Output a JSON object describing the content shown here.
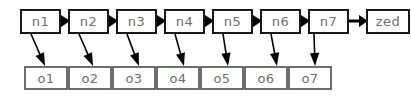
{
  "diagram": {
    "type": "linked-list-with-outputs",
    "background_color": "#fefefe",
    "node_stroke_color": "#1a1a1a",
    "output_stroke_color": "#4a4a4a",
    "label_color": "#6f6f6f",
    "arrow_color": "#000000",
    "chain": {
      "nodes": [
        {
          "id": "n1",
          "label": "n1",
          "x": 21,
          "y": 10,
          "w": 39,
          "h": 23
        },
        {
          "id": "n2",
          "label": "n2",
          "x": 69,
          "y": 10,
          "w": 39,
          "h": 23
        },
        {
          "id": "n3",
          "label": "n3",
          "x": 117,
          "y": 10,
          "w": 39,
          "h": 23
        },
        {
          "id": "n4",
          "label": "n4",
          "x": 165,
          "y": 10,
          "w": 39,
          "h": 23
        },
        {
          "id": "n5",
          "label": "n5",
          "x": 213,
          "y": 10,
          "w": 39,
          "h": 23
        },
        {
          "id": "n6",
          "label": "n6",
          "x": 261,
          "y": 10,
          "w": 39,
          "h": 23
        },
        {
          "id": "n7",
          "label": "n7",
          "x": 309,
          "y": 10,
          "w": 39,
          "h": 23
        },
        {
          "id": "zed",
          "label": "zed",
          "x": 367,
          "y": 10,
          "w": 42,
          "h": 23
        }
      ],
      "arrows": [
        {
          "from": "n1",
          "to": "n2",
          "x1": 60,
          "x2": 69,
          "y": 21
        },
        {
          "from": "n2",
          "to": "n3",
          "x1": 108,
          "x2": 117,
          "y": 21
        },
        {
          "from": "n3",
          "to": "n4",
          "x1": 156,
          "x2": 165,
          "y": 21
        },
        {
          "from": "n4",
          "to": "n5",
          "x1": 204,
          "x2": 213,
          "y": 21
        },
        {
          "from": "n5",
          "to": "n6",
          "x1": 252,
          "x2": 261,
          "y": 21
        },
        {
          "from": "n6",
          "to": "n7",
          "x1": 300,
          "x2": 309,
          "y": 21
        },
        {
          "from": "n7",
          "to": "zed",
          "x1": 348,
          "x2": 367,
          "y": 21
        }
      ]
    },
    "outputs": {
      "boxes": [
        {
          "id": "o1",
          "label": "o1",
          "x": 25,
          "y": 67,
          "w": 42,
          "h": 22
        },
        {
          "id": "o2",
          "label": "o2",
          "x": 69,
          "y": 67,
          "w": 42,
          "h": 22
        },
        {
          "id": "o3",
          "label": "o3",
          "x": 113,
          "y": 67,
          "w": 42,
          "h": 22
        },
        {
          "id": "o4",
          "label": "o4",
          "x": 157,
          "y": 67,
          "w": 42,
          "h": 22
        },
        {
          "id": "o5",
          "label": "o5",
          "x": 201,
          "y": 67,
          "w": 42,
          "h": 22
        },
        {
          "id": "o6",
          "label": "o6",
          "x": 245,
          "y": 67,
          "w": 42,
          "h": 22
        },
        {
          "id": "o7",
          "label": "o7",
          "x": 289,
          "y": 67,
          "w": 42,
          "h": 22
        }
      ],
      "arrows": [
        {
          "from": "n1",
          "to": "o1",
          "x1": 31,
          "y1": 34,
          "x2": 45,
          "y2": 66
        },
        {
          "from": "n2",
          "to": "o2",
          "x1": 79,
          "y1": 34,
          "x2": 93,
          "y2": 66
        },
        {
          "from": "n3",
          "to": "o3",
          "x1": 127,
          "y1": 34,
          "x2": 139,
          "y2": 66
        },
        {
          "from": "n4",
          "to": "o4",
          "x1": 175,
          "y1": 34,
          "x2": 184,
          "y2": 66
        },
        {
          "from": "n5",
          "to": "o5",
          "x1": 223,
          "y1": 34,
          "x2": 228,
          "y2": 66
        },
        {
          "from": "n6",
          "to": "o6",
          "x1": 271,
          "y1": 34,
          "x2": 277,
          "y2": 66
        },
        {
          "from": "n7",
          "to": "o7",
          "x1": 314,
          "y1": 34,
          "x2": 315,
          "y2": 66
        }
      ]
    }
  }
}
